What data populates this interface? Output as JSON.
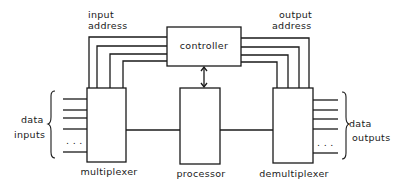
{
  "diagram": {
    "blocks": {
      "controller": {
        "label": "controller"
      },
      "multiplexer": {
        "label": "multiplexer"
      },
      "processor": {
        "label": "processor"
      },
      "demultiplexer": {
        "label": "demultiplexer"
      }
    },
    "labels": {
      "input_address_line1": "input",
      "input_address_line2": "address",
      "output_address_line1": "output",
      "output_address_line2": "address",
      "data_inputs_line1": "data",
      "data_inputs_line2": "inputs",
      "data_outputs_line1": "data",
      "data_outputs_line2": "outputs",
      "ellipsis_in": ". . .",
      "ellipsis_out": ". . ."
    },
    "connections": [
      {
        "from": "controller",
        "to": "multiplexer",
        "label": "input address",
        "lines": 4
      },
      {
        "from": "controller",
        "to": "demultiplexer",
        "label": "output address",
        "lines": 4
      },
      {
        "from": "controller",
        "to": "processor",
        "type": "bidirectional-arrow"
      },
      {
        "from": "multiplexer",
        "to": "processor"
      },
      {
        "from": "processor",
        "to": "demultiplexer"
      }
    ],
    "colors": {
      "ink": "#1a1a1a",
      "background": "#ffffff"
    }
  }
}
